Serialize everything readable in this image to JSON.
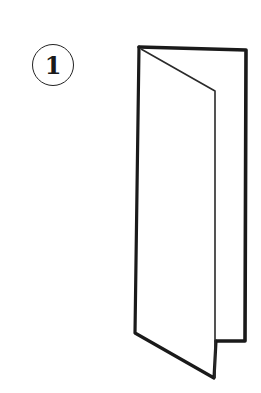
{
  "diagram": {
    "step": {
      "number": "1"
    },
    "illustration": {
      "subject": "tri-fold brochure, partially opened",
      "stroke_color": "#1a1a1a",
      "background": "#ffffff"
    }
  }
}
